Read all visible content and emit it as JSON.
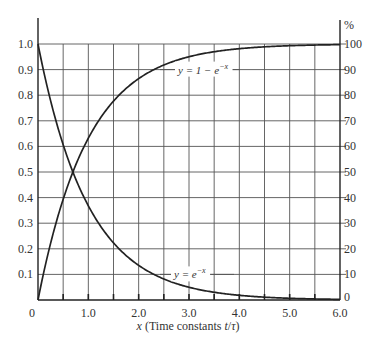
{
  "chart_data": {
    "type": "line",
    "title": "",
    "xlabel": "x (Time constants t/τ)",
    "ylabel": "",
    "ylabel_right": "%",
    "xlim": [
      0,
      6.0
    ],
    "ylim": [
      0,
      1.0
    ],
    "ylim_right": [
      0,
      100
    ],
    "grid": true,
    "grid_x_step": 0.5,
    "grid_y_step": 0.1,
    "x_ticks": [
      "0",
      "1.0",
      "2.0",
      "3.0",
      "4.0",
      "5.0",
      "6.0"
    ],
    "y_ticks_left": [
      "0.1",
      "0.2",
      "0.3",
      "0.4",
      "0.5",
      "0.6",
      "0.7",
      "0.8",
      "0.9",
      "1.0"
    ],
    "y_ticks_right": [
      "0",
      "10",
      "20",
      "30",
      "40",
      "50",
      "60",
      "70",
      "80",
      "90",
      "100"
    ],
    "x": [
      0,
      0.5,
      1.0,
      1.5,
      2.0,
      2.5,
      3.0,
      3.5,
      4.0,
      4.5,
      5.0,
      5.5,
      6.0
    ],
    "series": [
      {
        "name": "y = 1 − e^−x",
        "label": "y = 1 − e",
        "label_exp": "−x",
        "values": [
          0,
          0.393,
          0.632,
          0.777,
          0.865,
          0.918,
          0.95,
          0.97,
          0.982,
          0.989,
          0.993,
          0.996,
          0.998
        ]
      },
      {
        "name": "y = e^−x",
        "label": "y = e",
        "label_exp": "−x",
        "values": [
          1.0,
          0.607,
          0.368,
          0.223,
          0.135,
          0.082,
          0.05,
          0.03,
          0.018,
          0.011,
          0.007,
          0.004,
          0.002
        ]
      }
    ],
    "annotations": [
      {
        "text": "y = 1 − e^−x",
        "x": 2.75,
        "y": 0.9
      },
      {
        "text": "y = e^−x",
        "x": 2.4,
        "y": 0.1
      }
    ]
  }
}
